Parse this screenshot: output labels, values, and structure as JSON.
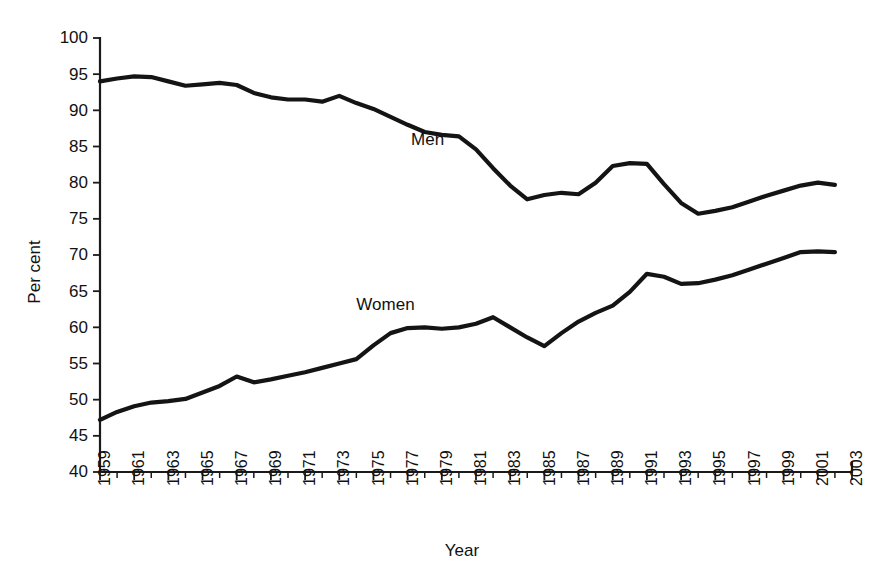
{
  "chart_data": {
    "type": "line",
    "title": "",
    "xlabel": "Year",
    "ylabel": "Per cent",
    "xlim": [
      1959,
      2003
    ],
    "ylim": [
      40,
      100
    ],
    "grid": false,
    "legend_position": "inline-annotations",
    "yticks": [
      40,
      45,
      50,
      55,
      60,
      65,
      70,
      75,
      80,
      85,
      90,
      95,
      100
    ],
    "ytick_labels": [
      "40",
      "45",
      "50",
      "55",
      "60",
      "65",
      "70",
      "75",
      "80",
      "85",
      "90",
      "95",
      "100"
    ],
    "xticks": [
      1959,
      1961,
      1963,
      1965,
      1967,
      1969,
      1971,
      1973,
      1975,
      1977,
      1979,
      1981,
      1983,
      1985,
      1987,
      1989,
      1991,
      1993,
      1995,
      1997,
      1999,
      2001,
      2003
    ],
    "xtick_labels": [
      "1959",
      "1961",
      "1963",
      "1965",
      "1967",
      "1969",
      "1971",
      "1973",
      "1975",
      "1977",
      "1979",
      "1981",
      "1983",
      "1985",
      "1987",
      "1989",
      "1991",
      "1993",
      "1995",
      "1997",
      "1999",
      "2001",
      "2003"
    ],
    "x": [
      1959,
      1960,
      1961,
      1962,
      1963,
      1964,
      1965,
      1966,
      1967,
      1968,
      1969,
      1970,
      1971,
      1972,
      1973,
      1974,
      1975,
      1976,
      1977,
      1978,
      1979,
      1980,
      1981,
      1982,
      1983,
      1984,
      1985,
      1986,
      1987,
      1988,
      1989,
      1990,
      1991,
      1992,
      1993,
      1994,
      1995,
      1996,
      1997,
      1998,
      1999,
      2000,
      2001,
      2002
    ],
    "series": [
      {
        "name": "Men",
        "color": "#141414",
        "annotation": "Men",
        "values": [
          94.0,
          94.4,
          94.7,
          94.6,
          94.0,
          93.4,
          93.6,
          93.8,
          93.5,
          92.4,
          91.8,
          91.5,
          91.5,
          91.2,
          92.0,
          91.0,
          90.2,
          89.1,
          88.0,
          87.0,
          86.6,
          86.4,
          84.6,
          82.0,
          79.6,
          77.7,
          78.3,
          78.6,
          78.4,
          80.0,
          82.3,
          82.7,
          82.6,
          79.8,
          77.2,
          75.7,
          76.1,
          76.6,
          77.4,
          78.2,
          78.9,
          79.6,
          80.0,
          79.7
        ]
      },
      {
        "name": "Women",
        "color": "#141414",
        "annotation": "Women",
        "values": [
          47.2,
          48.3,
          49.1,
          49.6,
          49.8,
          50.1,
          51.0,
          51.9,
          53.2,
          52.4,
          52.8,
          53.3,
          53.8,
          54.4,
          55.0,
          55.6,
          57.5,
          59.2,
          59.9,
          60.0,
          59.8,
          60.0,
          60.5,
          61.4,
          60.0,
          58.6,
          57.4,
          59.2,
          60.8,
          62.0,
          63.0,
          64.9,
          67.4,
          67.0,
          66.0,
          66.1,
          66.6,
          67.2,
          68.0,
          68.8,
          69.6,
          70.4,
          70.5,
          70.4
        ]
      }
    ],
    "annotations": [
      {
        "text": "Men",
        "x_year": 1977.2,
        "y_value": 85.2
      },
      {
        "text": "Women",
        "x_year": 1974.0,
        "y_value": 62.4
      }
    ]
  }
}
